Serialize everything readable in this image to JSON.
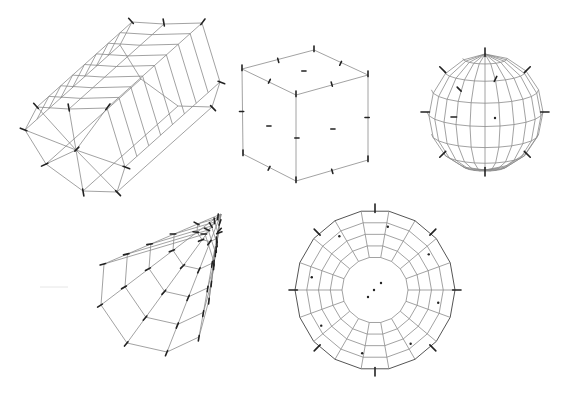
{
  "figure": {
    "width": 570,
    "height": 397,
    "background": "#ffffff",
    "line_color": "#8a8a8a",
    "tick_color": "#222222"
  },
  "shapes": [
    {
      "id": "cylinder",
      "label": "octagonal-cylinder",
      "type": "cylinder",
      "cap_center": [
        76,
        150
      ],
      "cap_vertices": [
        [
          37,
          107
        ],
        [
          25,
          130
        ],
        [
          46,
          164
        ],
        [
          83,
          191
        ],
        [
          117,
          192
        ],
        [
          125,
          167
        ],
        [
          107,
          108
        ],
        [
          69,
          109
        ]
      ],
      "axis_offset": [
        95,
        -85
      ],
      "segments": 8
    },
    {
      "id": "cube",
      "label": "cube",
      "type": "cube",
      "top": [
        [
          242,
          69
        ],
        [
          314,
          50
        ],
        [
          368,
          75
        ],
        [
          296,
          95
        ]
      ],
      "bottom": [
        [
          243,
          154
        ],
        [
          296,
          181
        ],
        [
          368,
          160
        ]
      ],
      "face_ticks": [
        [
          303,
          71
        ],
        [
          268,
          126
        ],
        [
          332,
          129
        ],
        [
          296,
          138
        ]
      ]
    },
    {
      "id": "sphere",
      "label": "uv-sphere",
      "type": "sphere",
      "center": [
        485,
        112
      ],
      "rx": 58,
      "ry": 58,
      "lat_rings": 8,
      "lon_segments": 12
    },
    {
      "id": "cone",
      "label": "cone",
      "type": "cone",
      "apex": [
        221,
        214
      ],
      "base": [
        [
          104,
          264
        ],
        [
          101,
          305
        ],
        [
          127,
          343
        ],
        [
          167,
          352
        ],
        [
          199,
          337
        ],
        [
          209,
          300
        ],
        [
          214,
          262
        ],
        [
          205,
          234
        ]
      ],
      "rings": 5
    },
    {
      "id": "torus",
      "label": "torus",
      "type": "torus",
      "center": [
        375,
        290
      ],
      "outer_r": 80,
      "inner_r": 33,
      "rings": 4,
      "segments": 18,
      "center_dots": [
        [
          368,
          297
        ],
        [
          374,
          290
        ],
        [
          381,
          283
        ]
      ]
    }
  ],
  "smudge": {
    "from": [
      40,
      287
    ],
    "to": [
      68,
      287
    ]
  }
}
